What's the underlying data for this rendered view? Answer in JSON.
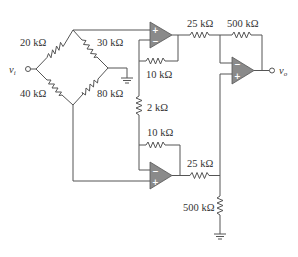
{
  "diagram": {
    "type": "circuit-schematic",
    "input": {
      "symbol": "v",
      "subscript": "i"
    },
    "output": {
      "symbol": "v",
      "subscript": "o"
    },
    "bridge": {
      "r_top_left": "20 kΩ",
      "r_top_right": "30 kΩ",
      "r_bottom_left": "40 kΩ",
      "r_bottom_right": "80 kΩ"
    },
    "first_stage": {
      "r_feedback_top": "10 kΩ",
      "r_gain": "2 kΩ",
      "r_feedback_bottom": "10 kΩ"
    },
    "second_stage": {
      "r_in_top": "25 kΩ",
      "r_feedback": "500 kΩ",
      "r_in_bottom": "25 kΩ",
      "r_ground": "500 kΩ"
    },
    "opamp_signs": {
      "plus": "+",
      "minus": "−"
    },
    "colors": {
      "wire": "#555555",
      "opamp_fill": "#8a8a8a",
      "text": "#333333",
      "background": "#ffffff"
    }
  }
}
